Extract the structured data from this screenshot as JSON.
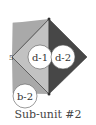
{
  "caption": "Sub-unit #2",
  "labels": {
    "d1": "d-1",
    "d2": "d-2",
    "b2": "b-2",
    "mark": "5"
  },
  "colors": {
    "rect": "#a9a9a9",
    "inner_triangle": "#c2c2c2",
    "dark_triangle": "#474747",
    "outline": "#555555"
  }
}
